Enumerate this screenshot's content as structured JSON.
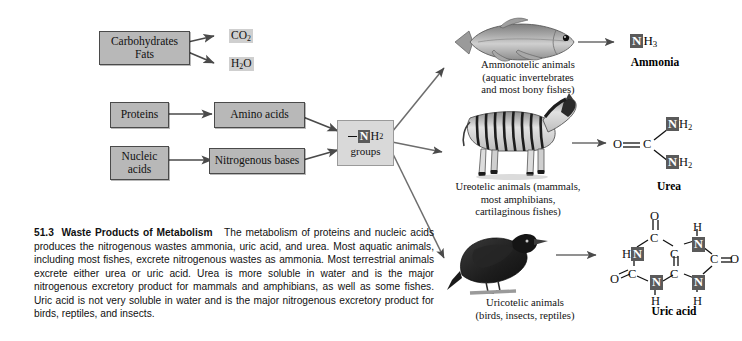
{
  "figure": {
    "number": "51.3",
    "title": "Waste Products of Metabolism",
    "caption": "The metabolism of proteins and nucleic acids produces the nitrogenous wastes ammonia, uric acid, and urea. Most aquatic animals, including most fishes, excrete nitrogenous wastes as ammonia. Most terrestrial animals excrete either urea or uric acid. Urea is more soluble in water and is the major nitrogenous excretory product for mammals and amphibians, as well as some fishes. Uric acid is not very soluble in water and is the major nitrogenous excretory product for birds, reptiles, and insects."
  },
  "inputs": [
    {
      "id": "carbohydrates-fats",
      "line1": "Carbohydrates",
      "line2": "Fats"
    },
    {
      "id": "proteins",
      "line1": "Proteins",
      "line2": ""
    },
    {
      "id": "nucleic-acids",
      "line1": "Nucleic",
      "line2": "acids"
    }
  ],
  "intermediates": [
    {
      "id": "amino-acids",
      "label": "Amino acids"
    },
    {
      "id": "nitrogenous-bases",
      "label": "Nitrogenous bases"
    }
  ],
  "byproducts": [
    {
      "id": "carbon-dioxide",
      "symbol": "CO",
      "subscript": "2"
    },
    {
      "id": "water",
      "symbol": "H",
      "subscript": "2",
      "tail": "O"
    }
  ],
  "amine_node": {
    "nitrogen": "N",
    "hydrogen": "H",
    "hydrogen_count": "2",
    "label": "groups"
  },
  "pathways": [
    {
      "id": "ammonotelic",
      "animal": "fish",
      "label_lines": [
        "Ammonotelic animals",
        "(aquatic invertebrates",
        "and most bony fishes)"
      ],
      "product_name": "Ammonia",
      "product_formula": {
        "n": "N",
        "h": "H",
        "count": "3"
      }
    },
    {
      "id": "ureotelic",
      "animal": "zebra",
      "label_lines": [
        "Ureotelic animals (mammals,",
        "most amphibians,",
        "cartilaginous fishes)"
      ],
      "product_name": "Urea",
      "product_atoms": {
        "oxygen": "O",
        "carbon": "C",
        "n": "N",
        "h": "H",
        "count": "2"
      }
    },
    {
      "id": "uricotelic",
      "animal": "bird",
      "label_lines": [
        "Uricotelic animals",
        "(birds, insects, reptiles)"
      ],
      "product_name": "Uric acid",
      "product_atoms": {
        "oxygen": "O",
        "carbon": "C",
        "n": "N",
        "h": "H"
      }
    }
  ],
  "colors": {
    "box_fill": "#b8b8b8",
    "box_light": "#d8d8d8",
    "node_fill": "#d9d9d9",
    "nitrogen_badge": "#5a5a5a",
    "arrow": "#555555",
    "text": "#111111"
  }
}
